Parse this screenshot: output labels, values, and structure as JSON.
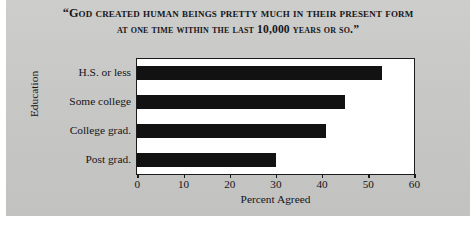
{
  "chart_data": {
    "type": "bar",
    "orientation": "horizontal",
    "title": "“GOD CREATED HUMAN BEINGS PRETTY MUCH IN THEIR PRESENT FORM AT ONE TIME WITHIN THE LAST 10,000 YEARS OR SO.”",
    "title_line1": "“God created human beings pretty much in their present form",
    "title_line2": "at one time within the last 10,000 years or so.”",
    "categories": [
      "H.S. or less",
      "Some college",
      "College grad.",
      "Post grad."
    ],
    "values": [
      53,
      45,
      41,
      30
    ],
    "xlabel": "Percent Agreed",
    "ylabel": "Education",
    "xlim": [
      0,
      60
    ],
    "xticks": [
      0,
      10,
      20,
      30,
      40,
      50,
      60
    ],
    "xtick_labels": [
      "0",
      "10",
      "20",
      "30",
      "40",
      "50",
      "60"
    ],
    "grid": false,
    "legend": false,
    "bar_color": "#121212",
    "plot_background": "#ffffff",
    "panel_background": "#c9c9c7"
  }
}
